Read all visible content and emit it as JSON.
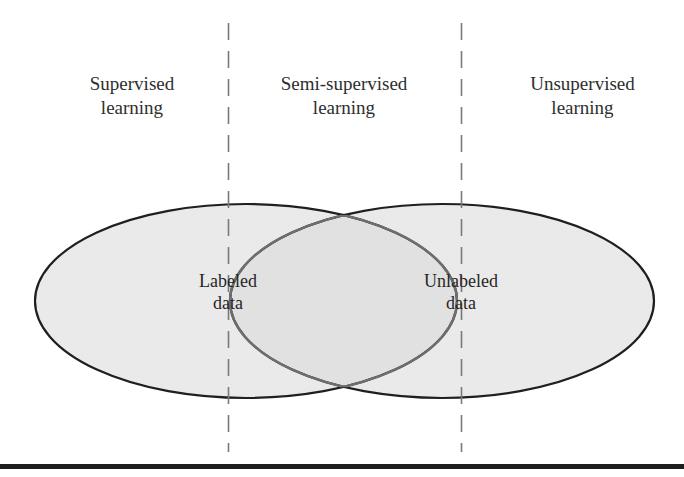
{
  "diagram": {
    "title": "",
    "regions": [
      {
        "id": "supervised",
        "line1": "Supervised",
        "line2": "learning"
      },
      {
        "id": "semi_supervised",
        "line1": "Semi-supervised",
        "line2": "learning"
      },
      {
        "id": "unsupervised",
        "line1": "Unsupervised",
        "line2": "learning"
      }
    ],
    "sets": [
      {
        "id": "labeled",
        "line1": "Labeled",
        "line2": "data"
      },
      {
        "id": "unlabeled",
        "line1": "Unlabeled",
        "line2": "data"
      }
    ],
    "dividers": [
      {
        "id": "divider-left",
        "style": "dashed"
      },
      {
        "id": "divider-right",
        "style": "dashed"
      }
    ],
    "colors": {
      "ellipse_fill": "#ececec",
      "ellipse_overlap_fill": "#e2e2e2",
      "ellipse_outer_stroke": "#1f1f1f",
      "ellipse_inner_stroke": "#707070",
      "divider_color": "#7a7a7a",
      "text_color": "#2e2e2e",
      "rule_color": "#1e1e1e"
    }
  }
}
